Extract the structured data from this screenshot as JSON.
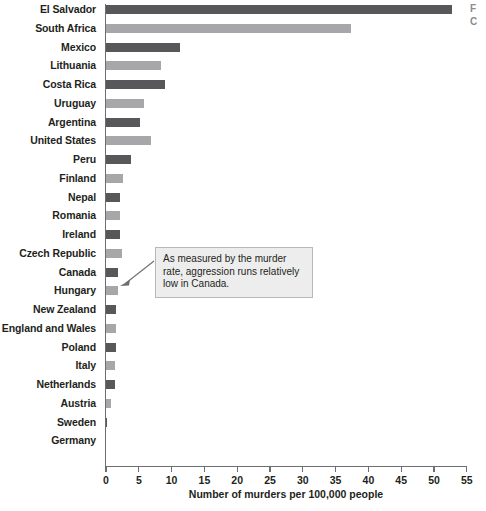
{
  "chart_data": {
    "type": "bar",
    "orientation": "horizontal",
    "title": "",
    "xlabel": "Number of murders per 100,000 people",
    "ylabel": "",
    "xlim": [
      0,
      55
    ],
    "xticks": [
      0,
      5,
      10,
      15,
      20,
      25,
      30,
      35,
      40,
      45,
      50,
      55
    ],
    "grid": false,
    "legend": "none",
    "categories": [
      "El Salvador",
      "South Africa",
      "Mexico",
      "Lithuania",
      "Costa Rica",
      "Uruguay",
      "Argentina",
      "United States",
      "Peru",
      "Finland",
      "Nepal",
      "Romania",
      "Ireland",
      "Czech Republic",
      "Canada",
      "Hungary",
      "New Zealand",
      "England and Wales",
      "Poland",
      "Italy",
      "Netherlands",
      "Austria",
      "Sweden",
      "Germany"
    ],
    "values": [
      52.7,
      37.3,
      11.3,
      8.4,
      9.0,
      5.8,
      5.2,
      6.9,
      3.8,
      2.6,
      2.1,
      2.1,
      2.1,
      2.4,
      1.9,
      1.8,
      1.6,
      1.5,
      1.5,
      1.4,
      1.3,
      0.7,
      0.2,
      0.0
    ],
    "annotations": [
      {
        "text": "As measured by the murder rate, aggression runs relatively low in Canada.",
        "points_to": "Canada"
      }
    ],
    "colors": {
      "bar_dark": "#58585a",
      "bar_light": "#a7a7a9",
      "axis": "#6d6e71",
      "text": "#231f20",
      "callout_fill": "#ededee",
      "callout_border": "#b8b8ba"
    }
  },
  "legend_fragment": {
    "line1": "F",
    "line2": "C"
  }
}
